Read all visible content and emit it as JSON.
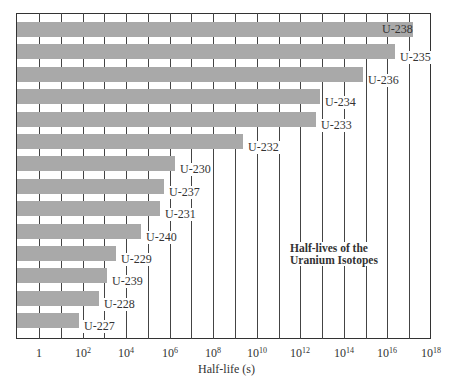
{
  "chart_data": {
    "type": "bar",
    "orientation": "horizontal",
    "title": "Half-lives of the Uranium Isotopes",
    "xlabel": "Half-life (s)",
    "ylabel": "",
    "xscale": "log",
    "xlim_log10": [
      -1,
      18
    ],
    "grid": true,
    "legend": null,
    "x_ticks": [
      "1",
      "10^2",
      "10^4",
      "10^6",
      "10^8",
      "10^10",
      "10^12",
      "10^14",
      "10^16",
      "10^18"
    ],
    "categories": [
      "U-238",
      "U-235",
      "U-236",
      "U-234",
      "U-233",
      "U-232",
      "U-230",
      "U-237",
      "U-231",
      "U-240",
      "U-229",
      "U-239",
      "U-228",
      "U-227"
    ],
    "values_log10_seconds": [
      17.15,
      16.35,
      14.87,
      12.89,
      12.7,
      9.35,
      6.26,
      5.76,
      5.56,
      4.7,
      3.54,
      3.14,
      2.74,
      1.82
    ],
    "values_seconds": [
      1.41e+17,
      2.2e+16,
      740000000000000.0,
      7700000000000.0,
      5000000000000.0,
      2200000000.0,
      1800000.0,
      580000.0,
      360000.0,
      51000.0,
      3500.0,
      1400.0,
      550.0,
      66.0
    ],
    "annotation": "Half-lives of the Uranium Isotopes"
  },
  "annotation": {
    "line1": "Half-lives of the",
    "line2": "Uranium Isotopes"
  },
  "axis": {
    "title": "Half-life (s)",
    "ticks": [
      {
        "base": "1",
        "exp": ""
      },
      {
        "base": "10",
        "exp": "2"
      },
      {
        "base": "10",
        "exp": "4"
      },
      {
        "base": "10",
        "exp": "6"
      },
      {
        "base": "10",
        "exp": "8"
      },
      {
        "base": "10",
        "exp": "10"
      },
      {
        "base": "10",
        "exp": "12"
      },
      {
        "base": "10",
        "exp": "14"
      },
      {
        "base": "10",
        "exp": "16"
      },
      {
        "base": "10",
        "exp": "18"
      }
    ]
  },
  "colors": {
    "bar": "#a9a9a9",
    "grid": "#444444",
    "background": "#ffffff"
  }
}
